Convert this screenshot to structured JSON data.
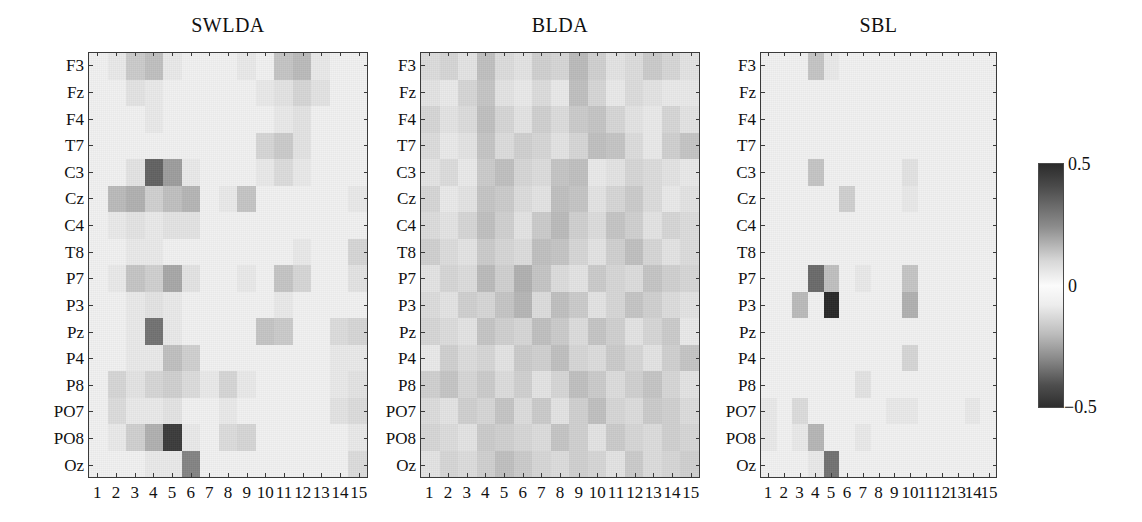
{
  "figure": {
    "background": "#ffffff",
    "axis_color": "#3a3a3a",
    "panel_bg": "#f2f2f2"
  },
  "chart_data": {
    "type": "heatmap",
    "title": "",
    "xlabel": "",
    "ylabel": "",
    "colormap": "diverging-gray (dark at extremes, white at zero)",
    "legend_position": "right",
    "grid": false,
    "zlim": [
      -0.5,
      0.5
    ],
    "colorbar": {
      "ticks": [
        0.5,
        0,
        -0.5
      ],
      "tick_labels": [
        "0.5",
        "0",
        "−0.5"
      ],
      "orientation": "vertical"
    },
    "y_categories": [
      "F3",
      "Fz",
      "F4",
      "T7",
      "C3",
      "Cz",
      "C4",
      "T8",
      "P7",
      "P3",
      "Pz",
      "P4",
      "P8",
      "PO7",
      "PO8",
      "Oz"
    ],
    "x_categories": [
      "1",
      "2",
      "3",
      "4",
      "5",
      "6",
      "7",
      "8",
      "9",
      "10",
      "11",
      "12",
      "13",
      "14",
      "15"
    ],
    "panels": [
      {
        "title": "SWLDA",
        "values": [
          [
            0.0,
            0.02,
            0.07,
            0.09,
            0.02,
            0.0,
            0.0,
            0.01,
            0.02,
            0.0,
            0.08,
            0.1,
            0.02,
            0.0,
            0.01
          ],
          [
            0.0,
            0.01,
            0.03,
            0.02,
            0.01,
            0.0,
            0.0,
            0.0,
            0.01,
            0.02,
            0.03,
            0.05,
            0.03,
            0.0,
            0.0
          ],
          [
            0.0,
            0.01,
            0.01,
            0.02,
            0.01,
            0.0,
            0.0,
            0.0,
            0.01,
            0.0,
            0.02,
            0.03,
            0.01,
            0.0,
            0.0
          ],
          [
            0.0,
            0.0,
            0.01,
            0.01,
            0.01,
            0.0,
            0.0,
            0.0,
            0.0,
            -0.05,
            -0.07,
            -0.03,
            0.0,
            0.0,
            0.0
          ],
          [
            0.0,
            0.01,
            0.03,
            0.3,
            0.16,
            0.02,
            0.0,
            0.0,
            0.0,
            -0.02,
            -0.04,
            0.02,
            0.01,
            0.0,
            0.0
          ],
          [
            0.0,
            -0.1,
            -0.12,
            -0.06,
            -0.09,
            -0.11,
            0.0,
            0.02,
            0.08,
            0.01,
            0.0,
            0.0,
            0.0,
            0.0,
            0.02
          ],
          [
            0.0,
            -0.02,
            -0.03,
            -0.02,
            -0.03,
            -0.03,
            0.0,
            0.0,
            0.01,
            0.0,
            0.0,
            0.0,
            0.0,
            0.0,
            0.01
          ],
          [
            0.0,
            0.01,
            0.02,
            0.02,
            0.01,
            0.0,
            0.0,
            0.0,
            0.0,
            0.0,
            0.01,
            0.02,
            0.0,
            0.0,
            0.05
          ],
          [
            0.0,
            0.02,
            0.08,
            0.06,
            0.14,
            0.03,
            0.0,
            0.01,
            0.02,
            0.01,
            0.08,
            0.05,
            0.0,
            0.01,
            0.03
          ],
          [
            0.0,
            0.01,
            0.02,
            0.03,
            0.02,
            0.01,
            0.0,
            0.0,
            0.0,
            0.0,
            0.02,
            0.01,
            0.0,
            0.0,
            0.0
          ],
          [
            0.0,
            0.01,
            0.02,
            0.26,
            0.02,
            0.0,
            0.0,
            0.0,
            0.01,
            0.08,
            0.07,
            0.01,
            0.0,
            -0.04,
            -0.05
          ],
          [
            0.0,
            0.01,
            0.02,
            0.02,
            -0.09,
            -0.06,
            0.0,
            0.0,
            0.0,
            0.01,
            0.01,
            0.0,
            0.0,
            -0.02,
            -0.02
          ],
          [
            0.0,
            0.05,
            0.03,
            -0.05,
            -0.06,
            -0.04,
            0.02,
            0.05,
            0.02,
            0.0,
            0.0,
            0.0,
            0.0,
            0.02,
            0.03
          ],
          [
            0.0,
            0.04,
            0.02,
            -0.02,
            -0.03,
            -0.01,
            0.01,
            0.02,
            0.01,
            0.0,
            0.0,
            0.0,
            0.0,
            0.03,
            0.04
          ],
          [
            0.0,
            0.02,
            0.06,
            0.12,
            0.4,
            0.02,
            0.0,
            0.04,
            0.05,
            0.0,
            0.0,
            0.0,
            0.0,
            0.01,
            0.02
          ],
          [
            0.0,
            0.0,
            0.01,
            0.02,
            0.02,
            0.22,
            0.01,
            0.0,
            0.01,
            0.0,
            0.0,
            0.0,
            0.0,
            0.0,
            0.04
          ]
        ]
      },
      {
        "title": "BLDA",
        "values": [
          [
            0.04,
            0.05,
            0.03,
            0.09,
            0.04,
            0.03,
            0.06,
            0.05,
            0.1,
            0.06,
            0.03,
            0.04,
            0.07,
            0.05,
            0.03
          ],
          [
            0.03,
            0.02,
            0.05,
            0.08,
            0.03,
            0.02,
            0.04,
            0.02,
            0.09,
            0.05,
            0.02,
            0.04,
            0.03,
            0.02,
            0.02
          ],
          [
            0.05,
            0.03,
            0.04,
            0.09,
            0.05,
            0.03,
            0.06,
            0.04,
            0.07,
            0.08,
            0.05,
            0.03,
            0.02,
            0.05,
            0.03
          ],
          [
            0.04,
            0.02,
            0.03,
            0.08,
            0.04,
            0.06,
            0.05,
            0.03,
            0.05,
            0.09,
            0.08,
            0.04,
            0.02,
            0.06,
            0.08
          ],
          [
            0.03,
            0.04,
            0.02,
            0.07,
            0.09,
            0.05,
            0.04,
            0.08,
            0.09,
            0.02,
            0.03,
            0.05,
            0.04,
            0.03,
            0.02
          ],
          [
            0.05,
            0.02,
            0.03,
            0.08,
            0.07,
            0.04,
            0.03,
            0.09,
            0.08,
            0.03,
            0.05,
            0.07,
            0.04,
            0.02,
            0.03
          ],
          [
            0.04,
            0.03,
            0.05,
            0.09,
            0.06,
            0.03,
            0.07,
            0.1,
            0.06,
            0.04,
            0.08,
            0.06,
            0.03,
            0.05,
            0.04
          ],
          [
            0.06,
            0.04,
            0.03,
            0.07,
            0.05,
            0.04,
            0.09,
            0.08,
            0.05,
            0.03,
            0.06,
            0.09,
            0.05,
            0.03,
            0.04
          ],
          [
            0.03,
            0.05,
            0.04,
            0.1,
            0.06,
            0.12,
            0.08,
            0.04,
            0.03,
            0.07,
            0.05,
            0.04,
            0.08,
            0.06,
            0.05
          ],
          [
            0.04,
            0.03,
            0.06,
            0.05,
            0.08,
            0.11,
            0.04,
            0.09,
            0.07,
            0.03,
            0.05,
            0.08,
            0.06,
            0.04,
            0.03
          ],
          [
            0.05,
            0.04,
            0.03,
            0.08,
            0.06,
            0.05,
            0.09,
            0.07,
            0.04,
            0.08,
            0.06,
            0.03,
            0.05,
            0.07,
            0.02
          ],
          [
            0.02,
            0.06,
            0.04,
            0.05,
            0.03,
            0.07,
            0.06,
            0.09,
            0.05,
            0.04,
            0.07,
            0.05,
            0.03,
            0.06,
            0.08
          ],
          [
            0.06,
            0.08,
            0.05,
            0.07,
            0.04,
            0.06,
            0.03,
            0.05,
            0.09,
            0.07,
            0.04,
            0.06,
            0.08,
            0.05,
            0.03
          ],
          [
            0.04,
            0.03,
            0.06,
            0.05,
            0.08,
            0.04,
            0.07,
            0.03,
            0.06,
            0.09,
            0.05,
            0.04,
            0.07,
            0.06,
            0.04
          ],
          [
            0.05,
            0.04,
            0.03,
            0.07,
            0.06,
            0.05,
            0.04,
            0.08,
            0.06,
            0.03,
            0.07,
            0.05,
            0.04,
            0.06,
            0.05
          ],
          [
            0.03,
            0.05,
            0.04,
            0.06,
            0.09,
            0.07,
            0.05,
            0.04,
            0.06,
            0.05,
            0.03,
            0.07,
            0.04,
            0.05,
            0.06
          ]
        ]
      },
      {
        "title": "SBL",
        "values": [
          [
            0.0,
            0.0,
            0.0,
            0.08,
            0.02,
            0.0,
            0.0,
            0.0,
            0.0,
            0.0,
            0.0,
            0.0,
            0.0,
            0.0,
            0.0
          ],
          [
            0.0,
            0.0,
            0.0,
            0.01,
            0.0,
            0.0,
            0.0,
            0.0,
            0.0,
            0.0,
            0.0,
            0.0,
            0.0,
            0.0,
            0.0
          ],
          [
            0.0,
            0.0,
            0.0,
            0.0,
            0.0,
            0.0,
            0.0,
            0.0,
            0.0,
            0.0,
            0.0,
            0.0,
            0.0,
            0.0,
            0.0
          ],
          [
            0.0,
            0.0,
            0.0,
            0.0,
            0.0,
            0.0,
            0.0,
            0.0,
            0.0,
            0.0,
            0.0,
            0.0,
            0.0,
            0.0,
            0.0
          ],
          [
            0.0,
            0.0,
            0.0,
            0.08,
            0.01,
            0.0,
            0.0,
            0.0,
            0.0,
            -0.03,
            0.0,
            0.0,
            0.0,
            0.0,
            0.0
          ],
          [
            0.0,
            0.0,
            0.0,
            0.01,
            0.0,
            0.06,
            0.0,
            0.0,
            0.0,
            -0.02,
            0.0,
            0.0,
            0.0,
            0.0,
            0.0
          ],
          [
            0.0,
            0.0,
            0.0,
            0.0,
            0.0,
            0.01,
            0.0,
            0.0,
            0.0,
            0.0,
            0.0,
            0.0,
            0.0,
            0.0,
            0.0
          ],
          [
            0.0,
            0.0,
            0.0,
            0.0,
            0.0,
            0.0,
            0.0,
            0.0,
            0.0,
            0.0,
            0.0,
            0.0,
            0.0,
            0.0,
            0.0
          ],
          [
            0.0,
            0.0,
            0.0,
            0.28,
            0.09,
            0.0,
            0.02,
            0.0,
            0.0,
            -0.08,
            0.0,
            0.0,
            0.0,
            0.0,
            0.0
          ],
          [
            0.0,
            0.0,
            0.1,
            0.0,
            0.45,
            0.0,
            0.0,
            0.0,
            0.0,
            0.12,
            0.0,
            0.0,
            0.0,
            0.0,
            0.0
          ],
          [
            0.0,
            0.0,
            0.0,
            0.0,
            0.0,
            0.0,
            0.0,
            0.0,
            0.0,
            0.0,
            0.0,
            0.0,
            0.0,
            0.0,
            0.0
          ],
          [
            0.0,
            0.0,
            0.0,
            0.0,
            0.0,
            0.0,
            0.0,
            0.0,
            0.0,
            -0.05,
            0.0,
            0.0,
            0.0,
            0.0,
            0.0
          ],
          [
            0.0,
            0.0,
            0.0,
            0.0,
            0.0,
            0.0,
            -0.03,
            0.0,
            0.0,
            0.0,
            0.0,
            0.0,
            0.0,
            0.0,
            0.0
          ],
          [
            0.02,
            0.0,
            0.04,
            0.0,
            0.0,
            0.0,
            0.0,
            0.0,
            0.02,
            0.02,
            0.0,
            0.0,
            0.0,
            0.02,
            0.0
          ],
          [
            0.02,
            0.0,
            0.02,
            0.11,
            0.0,
            0.0,
            0.02,
            0.0,
            0.0,
            0.0,
            0.0,
            0.0,
            0.0,
            0.0,
            0.0
          ],
          [
            0.0,
            0.0,
            0.0,
            0.02,
            0.26,
            0.0,
            0.0,
            0.0,
            0.0,
            0.0,
            0.0,
            0.0,
            0.0,
            0.0,
            0.0
          ]
        ]
      }
    ]
  }
}
